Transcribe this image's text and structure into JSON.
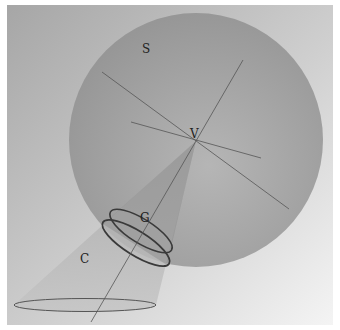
{
  "figure": {
    "type": "3d-geometry-illustration",
    "labels": {
      "sphere": "S",
      "vertex": "V",
      "circle": "G",
      "cone": "C"
    },
    "colors": {
      "background_dark": "#a9a9a9",
      "background_light": "#f2f2f2",
      "sphere_fill": "#9e9e9e",
      "cone_fill": "#b0b0b0",
      "line": "#555555",
      "ellipse_stroke": "#3a3a3a"
    }
  }
}
